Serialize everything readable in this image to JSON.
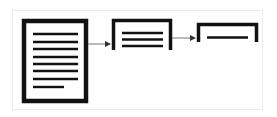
{
  "diagram": {
    "colors": {
      "stroke": "#111111",
      "arrow": "#777777",
      "frame": "#ececec",
      "background": "#ffffff"
    },
    "nodes": [
      {
        "id": "full-document",
        "icon": "document-page-icon",
        "text_lines": 8
      },
      {
        "id": "condensed-document",
        "icon": "document-partial-icon",
        "text_lines": 3
      },
      {
        "id": "single-line-document",
        "icon": "document-minimal-icon",
        "text_lines": 1
      }
    ],
    "edges": [
      {
        "from": "full-document",
        "to": "condensed-document"
      },
      {
        "from": "condensed-document",
        "to": "single-line-document"
      }
    ]
  }
}
